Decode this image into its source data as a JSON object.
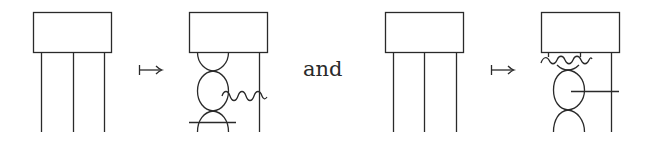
{
  "conjunction": "and",
  "arrow_symbol": "↦",
  "stroke_color": "#2a2a2a",
  "diagrams": [
    {
      "id": "lhs-1",
      "description": "box with three straight wires"
    },
    {
      "id": "rhs-1",
      "description": "box with two wires fused through bulges, wavy wire attached to middle oval, crossing horizontal bar at bottom"
    },
    {
      "id": "lhs-2",
      "description": "box with three straight wires"
    },
    {
      "id": "rhs-2",
      "description": "box with wavy wire across top, oval with horizontal wire to right strand"
    }
  ]
}
